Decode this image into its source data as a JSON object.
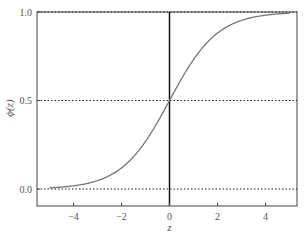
{
  "chart_data": {
    "type": "line",
    "title": "",
    "xlabel": "z",
    "ylabel": "ϕ(z)",
    "xlim": [
      -5.4,
      5.4
    ],
    "ylim": [
      -0.1,
      1.0
    ],
    "xticks": [
      -4,
      -2,
      0,
      2,
      4
    ],
    "xtick_labels": [
      "−4",
      "−2",
      "0",
      "2",
      "4"
    ],
    "yticks": [
      0.0,
      0.5,
      1.0
    ],
    "ytick_labels": [
      "0.0",
      "0.5",
      "1.0"
    ],
    "grid": false,
    "hlines": [
      0.0,
      0.5,
      1.0
    ],
    "vlines": [
      0.0
    ],
    "series": [
      {
        "name": "sigmoid",
        "function": "1/(1+exp(-z))",
        "x": [
          -5,
          -4,
          -3,
          -2,
          -1,
          0,
          1,
          2,
          3,
          4,
          5
        ],
        "values": [
          0.007,
          0.018,
          0.047,
          0.119,
          0.269,
          0.5,
          0.731,
          0.881,
          0.953,
          0.982,
          0.993
        ]
      }
    ]
  },
  "colors": {
    "curve": "#777777",
    "axis": "#444444",
    "dotted": "#222222",
    "vline": "#111111"
  }
}
